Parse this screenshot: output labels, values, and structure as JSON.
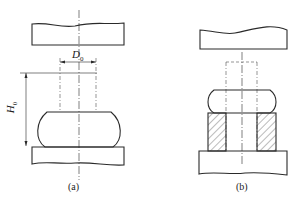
{
  "figure": {
    "panels": [
      {
        "id": "a",
        "caption": "(a)",
        "dimensions": {
          "diameter": "D",
          "diameter_sub": "0",
          "height": "H",
          "height_sub": "0"
        }
      },
      {
        "id": "b",
        "caption": "(b)"
      }
    ],
    "colors": {
      "line": "#2a2a2a",
      "hatch": "#555555",
      "background": "#ffffff"
    }
  }
}
